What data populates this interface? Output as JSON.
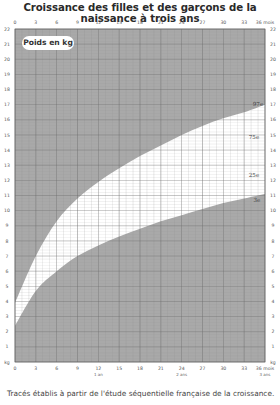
{
  "title": "Croissance des filles et des garçons de la naissance à trois ans",
  "footer": "Tracés établis à partir de l'étude séquentielle française de la croissance.",
  "badge": "Poids en kg",
  "chart_data": {
    "type": "area",
    "title": "Croissance des filles et des garçons de la naissance à trois ans",
    "ylabel": "Poids en kg",
    "xlabel": "mois",
    "xlim": [
      0,
      36
    ],
    "ylim": [
      0,
      22
    ],
    "x_ticks": [
      0,
      3,
      6,
      9,
      12,
      15,
      18,
      21,
      24,
      27,
      30,
      33,
      36
    ],
    "x_tick_labels": [
      "0",
      "3",
      "6",
      "9",
      "12",
      "15",
      "18",
      "21",
      "24",
      "27",
      "30",
      "33",
      "36 mois"
    ],
    "x_sub_labels": [
      {
        "x": 12,
        "label": "1 an"
      },
      {
        "x": 24,
        "label": "2 ans"
      },
      {
        "x": 36,
        "label": "3 ans"
      }
    ],
    "y_ticks": [
      0,
      1,
      2,
      3,
      4,
      5,
      6,
      7,
      8,
      9,
      10,
      11,
      12,
      13,
      14,
      15,
      16,
      17,
      18,
      19,
      20,
      21,
      22
    ],
    "y_unit_label": "kg",
    "grid": true,
    "x": [
      0,
      3,
      6,
      9,
      12,
      15,
      18,
      21,
      24,
      27,
      30,
      33,
      36
    ],
    "series": [
      {
        "name": "97e",
        "values": [
          3.9,
          7.0,
          9.3,
          10.8,
          11.9,
          12.8,
          13.6,
          14.3,
          15.0,
          15.6,
          16.1,
          16.5,
          17.0
        ]
      },
      {
        "name": "75e",
        "values": [
          3.5,
          6.4,
          8.4,
          9.8,
          10.8,
          11.7,
          12.4,
          13.1,
          13.6,
          14.1,
          14.5,
          14.9,
          15.3
        ]
      },
      {
        "name": "25e",
        "values": [
          3.0,
          5.6,
          7.3,
          8.5,
          9.4,
          10.1,
          10.7,
          11.2,
          11.6,
          12.0,
          12.4,
          12.8,
          13.1
        ]
      },
      {
        "name": "3e",
        "values": [
          2.4,
          4.7,
          6.0,
          7.0,
          7.7,
          8.3,
          8.8,
          9.3,
          9.7,
          10.1,
          10.5,
          10.8,
          11.1
        ]
      }
    ],
    "band": {
      "upper": "97e",
      "lower": "3e",
      "fill": "#ffffff"
    },
    "outside_fill": "#a9a9a9",
    "annotations": [
      "97e",
      "75e",
      "25e",
      "3e"
    ]
  }
}
